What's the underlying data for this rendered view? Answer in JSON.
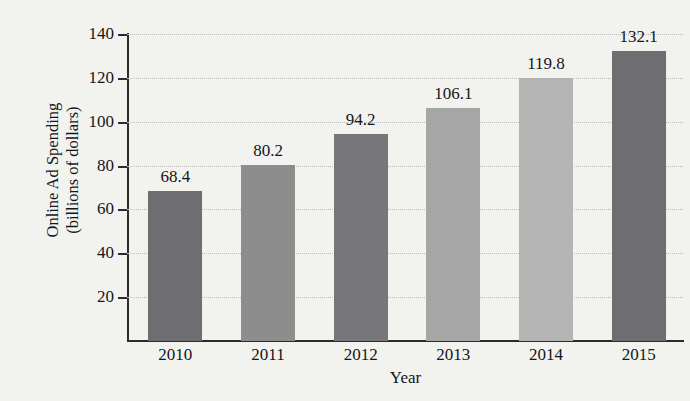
{
  "chart_data": {
    "type": "bar",
    "title": "",
    "xlabel": "Year",
    "ylabel": "Online Ad Spending (billions of dollars)",
    "ylabel_lines": [
      "Online Ad Spending",
      "(billions of dollars)"
    ],
    "categories": [
      "2010",
      "2011",
      "2012",
      "2013",
      "2014",
      "2015"
    ],
    "values": [
      68.4,
      80.2,
      94.2,
      106.1,
      119.8,
      132.1
    ],
    "value_labels": [
      "68.4",
      "80.2",
      "94.2",
      "106.1",
      "119.8",
      "132.1"
    ],
    "bar_colors": [
      "#6e6e70",
      "#8d8d8e",
      "#77777a",
      "#a6a6a6",
      "#b4b4b4",
      "#6e6e70"
    ],
    "ylim": [
      0,
      140
    ],
    "yticks": [
      20,
      40,
      60,
      80,
      100,
      120,
      140
    ],
    "ytick_labels": [
      "20",
      "40",
      "60",
      "80",
      "100",
      "120",
      "140"
    ],
    "grid": true,
    "grid_style": "dotted",
    "grid_color": "#b9b9b5",
    "legend": "none",
    "axis_color": "#2b2c30",
    "background_color": "#f2f2ef"
  }
}
